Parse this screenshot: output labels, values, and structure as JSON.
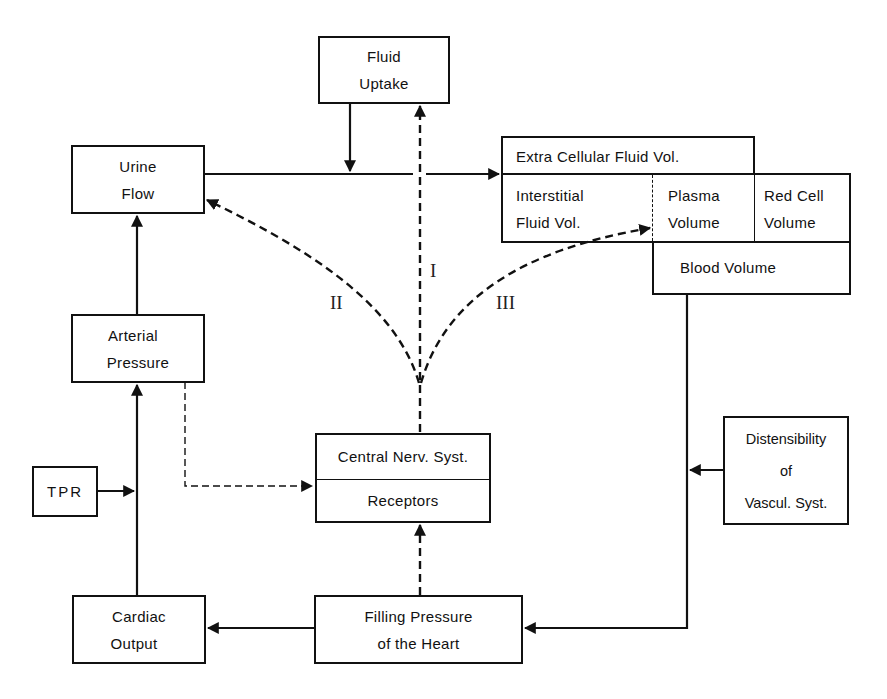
{
  "diagram": {
    "type": "physiological feedback block diagram",
    "boxes": {
      "fluid_uptake": {
        "line1": "Fluid",
        "line2": "Uptake"
      },
      "urine_flow": {
        "line1": "Urine",
        "line2": "Flow"
      },
      "extra_cellular": {
        "label": "Extra Cellular Fluid Vol."
      },
      "interstitial": {
        "line1": "Interstitial",
        "line2": "Fluid Vol."
      },
      "plasma": {
        "line1": "Plasma",
        "line2": "Volume"
      },
      "red_cell": {
        "line1": "Red Cell",
        "line2": "Volume"
      },
      "blood_volume": {
        "label": "Blood Volume"
      },
      "arterial_pressure": {
        "line1": "Arterial",
        "line2": "Pressure"
      },
      "tpr": {
        "label": "TPR"
      },
      "central_nerv": {
        "label": "Central Nerv. Syst."
      },
      "receptors": {
        "label": "Receptors"
      },
      "distensibility": {
        "line1": "Distensibility",
        "line2": "of",
        "line3": "Vascul. Syst."
      },
      "cardiac_output": {
        "line1": "Cardiac",
        "line2": "Output"
      },
      "filling_pressure": {
        "line1": "Filling Pressure",
        "line2": "of the Heart"
      }
    },
    "pathway_labels": {
      "one": "I",
      "two": "II",
      "three": "III"
    },
    "connections": [
      {
        "from": "Fluid Uptake",
        "to": "Urine Flow → ECF line",
        "style": "solid"
      },
      {
        "from": "Urine Flow",
        "to": "Extra Cellular Fluid Vol.",
        "style": "solid"
      },
      {
        "from": "Central Nerv. Syst.",
        "to": "Fluid Uptake",
        "style": "dashed",
        "label": "I"
      },
      {
        "from": "Central Nerv. Syst.",
        "to": "Urine Flow",
        "style": "dashed",
        "label": "II"
      },
      {
        "from": "Central Nerv. Syst.",
        "to": "Plasma Volume",
        "style": "dashed",
        "label": "III"
      },
      {
        "from": "Arterial Pressure",
        "to": "Urine Flow",
        "style": "solid"
      },
      {
        "from": "Arterial Pressure",
        "to": "Receptors",
        "style": "thin-dashed"
      },
      {
        "from": "Cardiac Output",
        "to": "Arterial Pressure",
        "style": "solid"
      },
      {
        "from": "TPR",
        "to": "Cardiac Output → Arterial Pressure line",
        "style": "solid"
      },
      {
        "from": "Filling Pressure of the Heart",
        "to": "Cardiac Output",
        "style": "solid"
      },
      {
        "from": "Filling Pressure of the Heart",
        "to": "Receptors",
        "style": "dashed"
      },
      {
        "from": "Blood Volume",
        "to": "Filling Pressure of the Heart",
        "style": "solid"
      },
      {
        "from": "Distensibility of Vascul. Syst.",
        "to": "Blood Volume → Filling Pressure line",
        "style": "solid"
      }
    ]
  },
  "colors": {
    "ink": "#111111",
    "background": "#ffffff"
  }
}
